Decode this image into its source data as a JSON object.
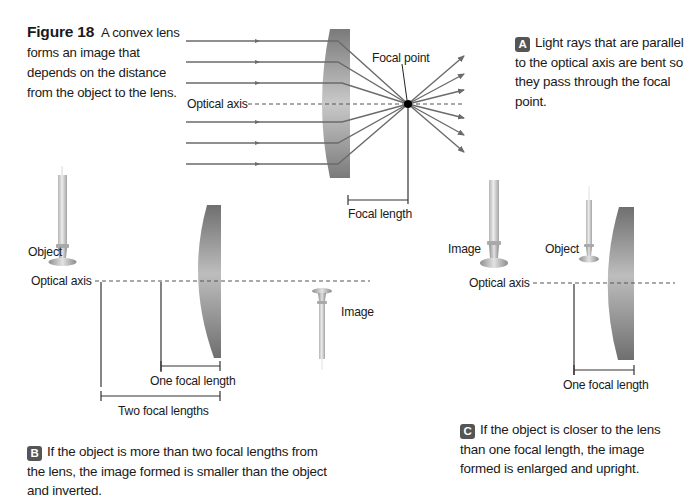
{
  "figure": {
    "number_label": "Figure 18",
    "caption": "A convex lens forms an image that depends on the distance from the object to the lens."
  },
  "panel_a": {
    "badge": "A",
    "description": "Light rays that are parallel to the optical axis are bent so they pass through the focal point.",
    "labels": {
      "optical_axis": "Optical axis",
      "focal_point": "Focal point",
      "focal_length": "Focal length"
    },
    "incoming_ray_count": 6,
    "colors": {
      "ray": "#6b6b6b",
      "lens_dark": "#7c7c7c",
      "lens_light": "#d0d0d0",
      "focal_point": "#000000"
    }
  },
  "panel_b": {
    "badge": "B",
    "description": "If the object is more than two focal lengths from the lens, the image formed is smaller than the object and inverted.",
    "labels": {
      "object": "Object",
      "optical_axis": "Optical axis",
      "image": "Image",
      "one_focal_length": "One focal length",
      "two_focal_lengths": "Two focal lengths"
    }
  },
  "panel_c": {
    "badge": "C",
    "description": "If the object is closer to the lens than one focal length, the image formed is enlarged and upright.",
    "labels": {
      "image": "Image",
      "object": "Object",
      "optical_axis": "Optical axis",
      "one_focal_length": "One focal length"
    }
  }
}
